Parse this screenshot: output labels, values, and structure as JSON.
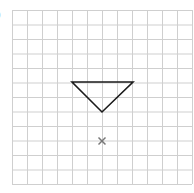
{
  "label": ")",
  "grid": {
    "left": 12,
    "top": 10,
    "cols": 12,
    "rows": 12,
    "cell_w": 15,
    "cell_h": 14.5,
    "line_color": "#cfcfcf"
  },
  "triangle": {
    "points": [
      [
        72,
        82
      ],
      [
        133,
        82
      ],
      [
        102,
        112
      ]
    ],
    "stroke": "#1a1a1a"
  },
  "center_mark": {
    "x": 102,
    "y": 141,
    "color": "#777777",
    "symbol": "×"
  }
}
